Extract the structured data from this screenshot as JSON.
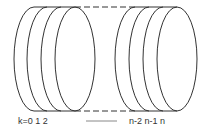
{
  "diagram": {
    "stroke_color": "#333333",
    "background": "#ffffff",
    "labels": {
      "left": "k=0 1 2",
      "right": "n-2 n-1 n"
    },
    "left_group": [
      {
        "index": "0",
        "cx": 34
      },
      {
        "index": "1",
        "cx": 47
      },
      {
        "index": "2",
        "cx": 61
      },
      {
        "index": "front",
        "cx": 75
      }
    ],
    "right_group": [
      {
        "index": "n-2",
        "cx": 135
      },
      {
        "index": "n-1",
        "cx": 149
      },
      {
        "index": "n",
        "cx": 163
      },
      {
        "index": "front",
        "cx": 177
      }
    ]
  }
}
